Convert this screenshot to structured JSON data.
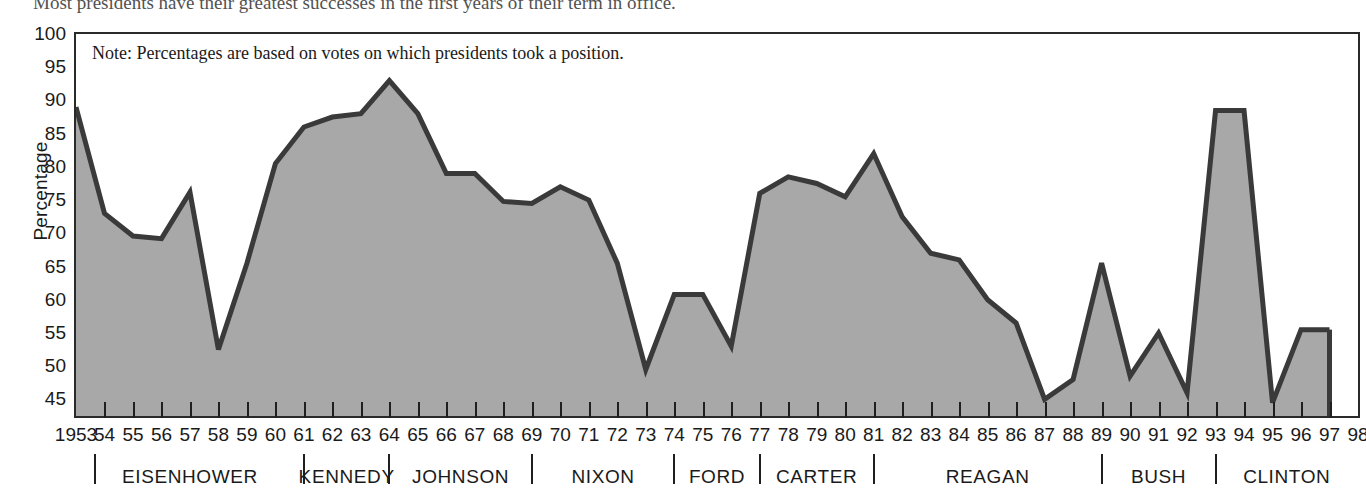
{
  "caption": "Most presidents have their greatest successes in the first years of their term in office.",
  "chart_data": {
    "type": "area",
    "title": "",
    "note": "Note: Percentages are based on votes on which presidents took a position.",
    "xlabel": "",
    "ylabel": "Percentage",
    "ylim": [
      42.5,
      100
    ],
    "yticks": [
      100,
      95,
      90,
      85,
      80,
      75,
      70,
      65,
      60,
      55,
      50,
      45
    ],
    "grid": false,
    "legend": "none",
    "line_color": "#3a3a3a",
    "fill_color": "#a8a8a8",
    "axis_color": "#2a2a2a",
    "x": [
      1953,
      1954,
      1955,
      1956,
      1957,
      1958,
      1959,
      1960,
      1961,
      1962,
      1963,
      1964,
      1965,
      1966,
      1967,
      1968,
      1969,
      1970,
      1971,
      1972,
      1973,
      1974,
      1975,
      1976,
      1977,
      1978,
      1979,
      1980,
      1981,
      1982,
      1983,
      1984,
      1985,
      1986,
      1987,
      1988,
      1989,
      1990,
      1991,
      1992,
      1993,
      1994,
      1995,
      1996,
      1997
    ],
    "xtick_labels": [
      "1953",
      "54",
      "55",
      "56",
      "57",
      "58",
      "59",
      "60",
      "61",
      "62",
      "63",
      "64",
      "65",
      "66",
      "67",
      "68",
      "69",
      "70",
      "71",
      "72",
      "73",
      "74",
      "75",
      "76",
      "77",
      "78",
      "79",
      "80",
      "81",
      "82",
      "83",
      "84",
      "85",
      "86",
      "87",
      "88",
      "89",
      "90",
      "91",
      "92",
      "93",
      "94",
      "95",
      "96",
      "97",
      "98"
    ],
    "values": [
      89.0,
      73.0,
      69.6,
      69.2,
      76.2,
      52.5,
      65.5,
      80.5,
      86.0,
      87.5,
      88.0,
      93.0,
      88.0,
      79.0,
      79.0,
      74.8,
      74.5,
      77.0,
      75.0,
      65.5,
      49.5,
      60.8,
      60.8,
      53.0,
      76.0,
      78.5,
      77.5,
      75.5,
      82.0,
      72.5,
      67.0,
      66.0,
      60.0,
      56.5,
      45.0,
      48.0,
      65.5,
      48.5,
      55.0,
      46.0,
      88.5,
      88.5,
      44.5,
      55.5,
      55.5
    ],
    "series": [
      {
        "name": "Presidential success rate on congressional votes",
        "values": [
          89.0,
          73.0,
          69.6,
          69.2,
          76.2,
          52.5,
          65.5,
          80.5,
          86.0,
          87.5,
          88.0,
          93.0,
          88.0,
          79.0,
          79.0,
          74.8,
          74.5,
          77.0,
          75.0,
          65.5,
          49.5,
          60.8,
          60.8,
          53.0,
          76.0,
          78.5,
          77.5,
          75.5,
          82.0,
          72.5,
          67.0,
          66.0,
          60.0,
          56.5,
          45.0,
          48.0,
          65.5,
          48.5,
          55.0,
          46.0,
          88.5,
          88.5,
          44.5,
          55.5,
          55.5
        ]
      }
    ],
    "presidents": [
      {
        "name": "EISENHOWER",
        "start": 1953,
        "end": 1961
      },
      {
        "name": "KENNEDY",
        "start": 1961,
        "end": 1964
      },
      {
        "name": "JOHNSON",
        "start": 1964,
        "end": 1969
      },
      {
        "name": "NIXON",
        "start": 1969,
        "end": 1974
      },
      {
        "name": "FORD",
        "start": 1974,
        "end": 1977
      },
      {
        "name": "CARTER",
        "start": 1977,
        "end": 1981
      },
      {
        "name": "REAGAN",
        "start": 1981,
        "end": 1989
      },
      {
        "name": "BUSH",
        "start": 1989,
        "end": 1993
      },
      {
        "name": "CLINTON",
        "start": 1993,
        "end": 1998
      }
    ]
  }
}
